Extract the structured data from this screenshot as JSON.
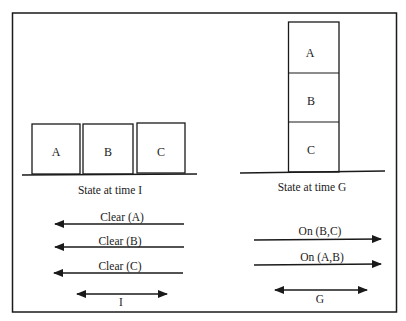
{
  "diagram": {
    "initial_state": {
      "caption": "State at time I",
      "blocks": [
        "A",
        "B",
        "C"
      ]
    },
    "goal_state": {
      "caption": "State at time G",
      "stack_top_to_bottom": [
        "A",
        "B",
        "C"
      ]
    },
    "initial_conditions": [
      {
        "label": "Clear (A)",
        "direction": "left"
      },
      {
        "label": "Clear (B)",
        "direction": "left"
      },
      {
        "label": "Clear (C)",
        "direction": "left"
      }
    ],
    "goal_conditions": [
      {
        "label": "On (B,C)",
        "direction": "right"
      },
      {
        "label": "On (A,B)",
        "direction": "right"
      }
    ],
    "time_markers": {
      "initial": "I",
      "goal": "G"
    },
    "colors": {
      "stroke": "#1a1a1a",
      "background": "#ffffff"
    }
  }
}
